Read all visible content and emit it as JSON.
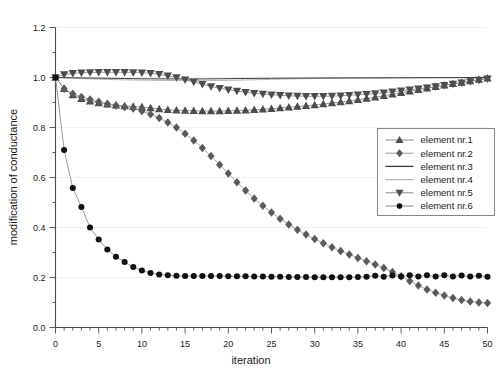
{
  "chart_data": {
    "type": "line",
    "title": "",
    "xlabel": "iteration",
    "ylabel": "modification of conductance",
    "xlim": [
      0,
      50
    ],
    "ylim": [
      0.0,
      1.2
    ],
    "xticks": [
      0,
      5,
      10,
      15,
      20,
      25,
      30,
      35,
      40,
      45,
      50
    ],
    "xtick_labels": [
      "0",
      "5",
      "10",
      "15",
      "20",
      "25",
      "30",
      "35",
      "40",
      "45",
      "50"
    ],
    "yticks": [
      0.0,
      0.2,
      0.4,
      0.6,
      0.8,
      1.0,
      1.2
    ],
    "ytick_labels": [
      "0.0",
      "0.2",
      "0.4",
      "0.6",
      "0.8",
      "1.0",
      "1.2"
    ],
    "grid": "horizontal-dotted",
    "legend_position": "right-middle",
    "x": [
      0,
      1,
      2,
      3,
      4,
      5,
      6,
      7,
      8,
      9,
      10,
      11,
      12,
      13,
      14,
      15,
      16,
      17,
      18,
      19,
      20,
      21,
      22,
      23,
      24,
      25,
      26,
      27,
      28,
      29,
      30,
      31,
      32,
      33,
      34,
      35,
      36,
      37,
      38,
      39,
      40,
      41,
      42,
      43,
      44,
      45,
      46,
      47,
      48,
      49,
      50
    ],
    "series": [
      {
        "name": "element nr.1",
        "marker": "triangle-up",
        "color": "#4d4d4d",
        "line_color": "#808080",
        "values": [
          1.0,
          0.955,
          0.93,
          0.915,
          0.905,
          0.898,
          0.893,
          0.889,
          0.886,
          0.884,
          0.882,
          0.878,
          0.874,
          0.871,
          0.869,
          0.868,
          0.867,
          0.866,
          0.866,
          0.866,
          0.867,
          0.868,
          0.869,
          0.871,
          0.873,
          0.875,
          0.878,
          0.881,
          0.884,
          0.887,
          0.89,
          0.894,
          0.898,
          0.902,
          0.906,
          0.911,
          0.916,
          0.921,
          0.927,
          0.933,
          0.939,
          0.945,
          0.951,
          0.957,
          0.963,
          0.969,
          0.975,
          0.98,
          0.986,
          0.992,
          0.997
        ]
      },
      {
        "name": "element nr.2",
        "marker": "diamond",
        "color": "#5a5a5a",
        "line_color": "#909090",
        "values": [
          1.0,
          0.955,
          0.935,
          0.922,
          0.912,
          0.903,
          0.895,
          0.888,
          0.882,
          0.876,
          0.866,
          0.853,
          0.838,
          0.82,
          0.8,
          0.775,
          0.748,
          0.718,
          0.686,
          0.651,
          0.616,
          0.581,
          0.548,
          0.516,
          0.487,
          0.46,
          0.435,
          0.412,
          0.391,
          0.372,
          0.354,
          0.337,
          0.321,
          0.306,
          0.292,
          0.278,
          0.265,
          0.252,
          0.238,
          0.222,
          0.205,
          0.186,
          0.168,
          0.152,
          0.139,
          0.128,
          0.118,
          0.11,
          0.104,
          0.1,
          0.098
        ]
      },
      {
        "name": "element nr.3",
        "marker": "none",
        "color": "#3a3a3a",
        "line_color": "#3a3a3a",
        "values": [
          1.0,
          0.9995,
          0.999,
          0.9985,
          0.998,
          0.9975,
          0.997,
          0.9965,
          0.996,
          0.9955,
          0.995,
          0.9948,
          0.9946,
          0.9944,
          0.9942,
          0.994,
          0.9941,
          0.9943,
          0.9946,
          0.995,
          0.9954,
          0.9958,
          0.9962,
          0.9965,
          0.9968,
          0.997,
          0.9972,
          0.9974,
          0.9976,
          0.9978,
          0.998,
          0.9981,
          0.9982,
          0.9983,
          0.9984,
          0.9985,
          0.9986,
          0.9987,
          0.9988,
          0.9989,
          0.999,
          0.9991,
          0.9992,
          0.9993,
          0.9994,
          0.9995,
          0.9996,
          0.9997,
          0.9998,
          0.9999,
          1.0
        ]
      },
      {
        "name": "element nr.4",
        "marker": "none",
        "color": "#b5b5b5",
        "line_color": "#b5b5b5",
        "values": [
          1.0,
          0.9985,
          0.997,
          0.9957,
          0.9945,
          0.9934,
          0.9924,
          0.9915,
          0.9907,
          0.99,
          0.9894,
          0.9888,
          0.9883,
          0.9879,
          0.9876,
          0.9874,
          0.9873,
          0.9874,
          0.9876,
          0.988,
          0.9886,
          0.9893,
          0.9901,
          0.991,
          0.9919,
          0.9928,
          0.9936,
          0.9943,
          0.9949,
          0.9954,
          0.9959,
          0.9963,
          0.9967,
          0.997,
          0.9973,
          0.9976,
          0.9978,
          0.998,
          0.9982,
          0.9984,
          0.9986,
          0.9988,
          0.999,
          0.9991,
          0.9993,
          0.9994,
          0.9995,
          0.9996,
          0.9997,
          0.9998,
          0.9999
        ]
      },
      {
        "name": "element nr.5",
        "marker": "triangle-down",
        "color": "#4d4d4d",
        "line_color": "#808080",
        "values": [
          1.0,
          1.012,
          1.017,
          1.019,
          1.02,
          1.021,
          1.021,
          1.021,
          1.021,
          1.02,
          1.019,
          1.017,
          1.013,
          1.007,
          1.0,
          0.991,
          0.982,
          0.973,
          0.964,
          0.957,
          0.951,
          0.946,
          0.941,
          0.937,
          0.934,
          0.931,
          0.929,
          0.927,
          0.926,
          0.925,
          0.925,
          0.925,
          0.926,
          0.927,
          0.929,
          0.931,
          0.933,
          0.936,
          0.939,
          0.943,
          0.947,
          0.951,
          0.955,
          0.959,
          0.964,
          0.969,
          0.974,
          0.979,
          0.984,
          0.99,
          0.995
        ]
      },
      {
        "name": "element nr.6",
        "marker": "circle",
        "color": "#111111",
        "line_color": "#808080",
        "values": [
          1.0,
          0.71,
          0.558,
          0.482,
          0.4,
          0.352,
          0.312,
          0.283,
          0.262,
          0.242,
          0.228,
          0.218,
          0.212,
          0.209,
          0.207,
          0.206,
          0.206,
          0.206,
          0.206,
          0.206,
          0.205,
          0.205,
          0.205,
          0.204,
          0.204,
          0.203,
          0.203,
          0.202,
          0.202,
          0.202,
          0.201,
          0.201,
          0.201,
          0.201,
          0.201,
          0.202,
          0.203,
          0.207,
          0.203,
          0.208,
          0.204,
          0.209,
          0.204,
          0.209,
          0.204,
          0.209,
          0.204,
          0.208,
          0.204,
          0.207,
          0.203
        ]
      }
    ]
  },
  "legend": {
    "entries": [
      {
        "label": "element nr.1"
      },
      {
        "label": "element nr.2"
      },
      {
        "label": "element nr.3"
      },
      {
        "label": "element nr.4"
      },
      {
        "label": "element nr.5"
      },
      {
        "label": "element nr.6"
      }
    ]
  }
}
